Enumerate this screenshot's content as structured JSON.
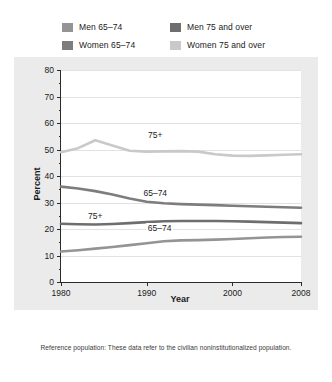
{
  "legend": {
    "items": [
      {
        "label": "Men 65–74",
        "color": "#949494",
        "key": "men_65_74"
      },
      {
        "label": "Men 75 and over",
        "color": "#6e6e6e",
        "key": "men_75_over"
      },
      {
        "label": "Women 65–74",
        "color": "#7d7d7d",
        "key": "women_65_74"
      },
      {
        "label": "Women 75 and over",
        "color": "#c9c9c9",
        "key": "women_75_over"
      }
    ]
  },
  "footnote": "Reference population: These data refer to the civilian noninstitutionalized population.",
  "inline_labels": [
    {
      "text": "75+",
      "x": 1991.0,
      "y": 55.5,
      "series": "women_75_over"
    },
    {
      "text": "65–74",
      "x": 1991.0,
      "y": 33.5,
      "series": "women_65_74"
    },
    {
      "text": "75+",
      "x": 1984.0,
      "y": 25.0,
      "series": "men_75_over"
    },
    {
      "text": "65–74",
      "x": 1991.5,
      "y": 20.5,
      "series": "men_65_74"
    }
  ],
  "chart_data": {
    "type": "line",
    "title": "",
    "xlabel": "Year",
    "ylabel": "Percent",
    "xlim": [
      1980,
      2008
    ],
    "ylim": [
      0,
      80
    ],
    "yticks": [
      0,
      10,
      20,
      30,
      40,
      50,
      60,
      70,
      80
    ],
    "xticks": [
      1980,
      1990,
      2000,
      2008
    ],
    "grid": "horizontal",
    "legend_position": "above-plot",
    "x": [
      1980,
      1982,
      1984,
      1986,
      1988,
      1990,
      1992,
      1994,
      1996,
      1998,
      2000,
      2002,
      2004,
      2006,
      2008
    ],
    "series": [
      {
        "name": "Women 75 and over",
        "color": "#c9c9c9",
        "values": [
          49.0,
          50.5,
          53.5,
          51.5,
          49.5,
          49.2,
          49.3,
          49.4,
          49.2,
          48.2,
          47.7,
          47.6,
          47.8,
          48.0,
          48.2
        ]
      },
      {
        "name": "Women 65–74",
        "color": "#7d7d7d",
        "values": [
          36.0,
          35.3,
          34.3,
          33.0,
          31.5,
          30.3,
          29.7,
          29.4,
          29.2,
          29.0,
          28.8,
          28.6,
          28.4,
          28.2,
          28.0
        ]
      },
      {
        "name": "Men 75 and over",
        "color": "#6e6e6e",
        "values": [
          22.0,
          21.8,
          21.7,
          21.9,
          22.2,
          22.6,
          22.9,
          23.0,
          23.0,
          23.0,
          22.9,
          22.8,
          22.6,
          22.4,
          22.2
        ]
      },
      {
        "name": "Men 65–74",
        "color": "#949494",
        "values": [
          11.5,
          12.0,
          12.6,
          13.2,
          13.9,
          14.6,
          15.4,
          15.7,
          15.8,
          16.0,
          16.2,
          16.5,
          16.8,
          17.0,
          17.1
        ]
      }
    ]
  }
}
